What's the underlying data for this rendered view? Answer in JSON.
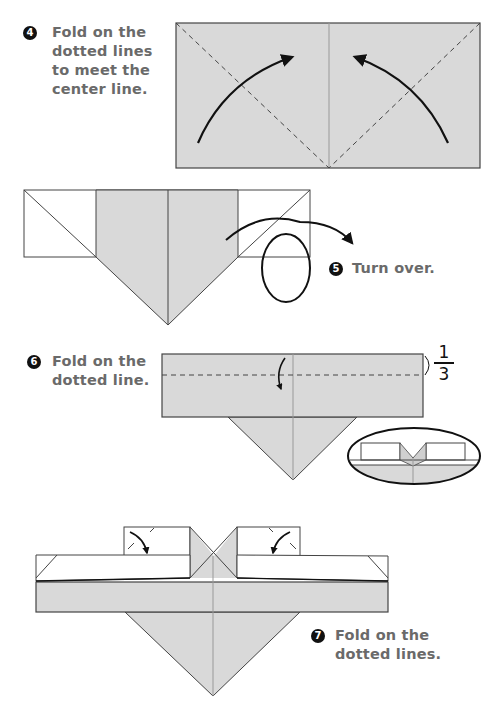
{
  "steps": [
    {
      "number": "4",
      "text": "Fold on the\ndotted lines\nto meet the\ncenter line."
    },
    {
      "number": "5",
      "text": "Turn over."
    },
    {
      "number": "6",
      "text": "Fold on the\ndotted line."
    },
    {
      "number": "7",
      "text": "Fold on the\ndotted lines."
    }
  ],
  "fraction": {
    "numerator": "1",
    "denominator": "3"
  },
  "colors": {
    "paper_gray": "#d9d9d9",
    "line": "#333333",
    "label_text": "#6a6a6a",
    "badge": "#111111"
  }
}
